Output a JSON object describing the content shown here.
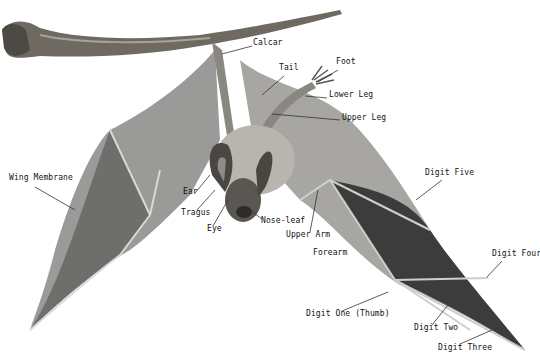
{
  "colors": {
    "background": "#ffffff",
    "label": "#111111",
    "leader": "#333333",
    "branch": "#6e6a62",
    "membrane_light": "#9a9a98",
    "membrane_dark": "#3c3c3c",
    "body": "#b8b4ae"
  },
  "labels": [
    {
      "id": "calcar",
      "text": "Calcar",
      "x": 253,
      "y": 42,
      "lx1": 252,
      "ly1": 46,
      "lx2": 222,
      "ly2": 54
    },
    {
      "id": "tail",
      "text": "Tail",
      "x": 279,
      "y": 67,
      "lx1": 284,
      "ly1": 76,
      "lx2": 262,
      "ly2": 95
    },
    {
      "id": "foot",
      "text": "Foot",
      "x": 336,
      "y": 61,
      "lx1": 338,
      "ly1": 70,
      "lx2": 318,
      "ly2": 82
    },
    {
      "id": "lower-leg",
      "text": "Lower Leg",
      "x": 329,
      "y": 94,
      "lx1": 327,
      "ly1": 98,
      "lx2": 305,
      "ly2": 96
    },
    {
      "id": "upper-leg",
      "text": "Upper Leg",
      "x": 342,
      "y": 117,
      "lx1": 340,
      "ly1": 120,
      "lx2": 272,
      "ly2": 114
    },
    {
      "id": "wing-membrane",
      "text": "Wing Membrane",
      "x": 9,
      "y": 177,
      "lx1": 35,
      "ly1": 187,
      "lx2": 75,
      "ly2": 210
    },
    {
      "id": "ear",
      "text": "Ear",
      "x": 183,
      "y": 191,
      "lx1": 195,
      "ly1": 193,
      "lx2": 210,
      "ly2": 175
    },
    {
      "id": "tragus",
      "text": "Tragus",
      "x": 181,
      "y": 212,
      "lx1": 197,
      "ly1": 210,
      "lx2": 215,
      "ly2": 190
    },
    {
      "id": "eye",
      "text": "Eye",
      "x": 207,
      "y": 228,
      "lx1": 213,
      "ly1": 226,
      "lx2": 228,
      "ly2": 200
    },
    {
      "id": "nose-leaf",
      "text": "Nose-leaf",
      "x": 261,
      "y": 220,
      "lx1": 262,
      "ly1": 219,
      "lx2": 250,
      "ly2": 210
    },
    {
      "id": "upper-arm",
      "text": "Upper Arm",
      "x": 286,
      "y": 234,
      "lx1": 310,
      "ly1": 232,
      "lx2": 318,
      "ly2": 190
    },
    {
      "id": "forearm",
      "text": "Forearm",
      "x": 313,
      "y": 252,
      "lx1": 0,
      "ly1": 0,
      "lx2": 0,
      "ly2": 0
    },
    {
      "id": "digit-five",
      "text": "Digit Five",
      "x": 425,
      "y": 172,
      "lx1": 442,
      "ly1": 180,
      "lx2": 416,
      "ly2": 200
    },
    {
      "id": "digit-four",
      "text": "Digit Four",
      "x": 492,
      "y": 253,
      "lx1": 502,
      "ly1": 261,
      "lx2": 487,
      "ly2": 277
    },
    {
      "id": "digit-one-thumb",
      "text": "Digit One (Thumb)",
      "x": 306,
      "y": 313,
      "lx1": 342,
      "ly1": 311,
      "lx2": 388,
      "ly2": 292
    },
    {
      "id": "digit-two",
      "text": "Digit Two",
      "x": 414,
      "y": 327,
      "lx1": 432,
      "ly1": 325,
      "lx2": 448,
      "ly2": 305
    },
    {
      "id": "digit-three",
      "text": "Digit Three",
      "x": 438,
      "y": 347,
      "lx1": 460,
      "ly1": 344,
      "lx2": 492,
      "ly2": 330
    }
  ]
}
